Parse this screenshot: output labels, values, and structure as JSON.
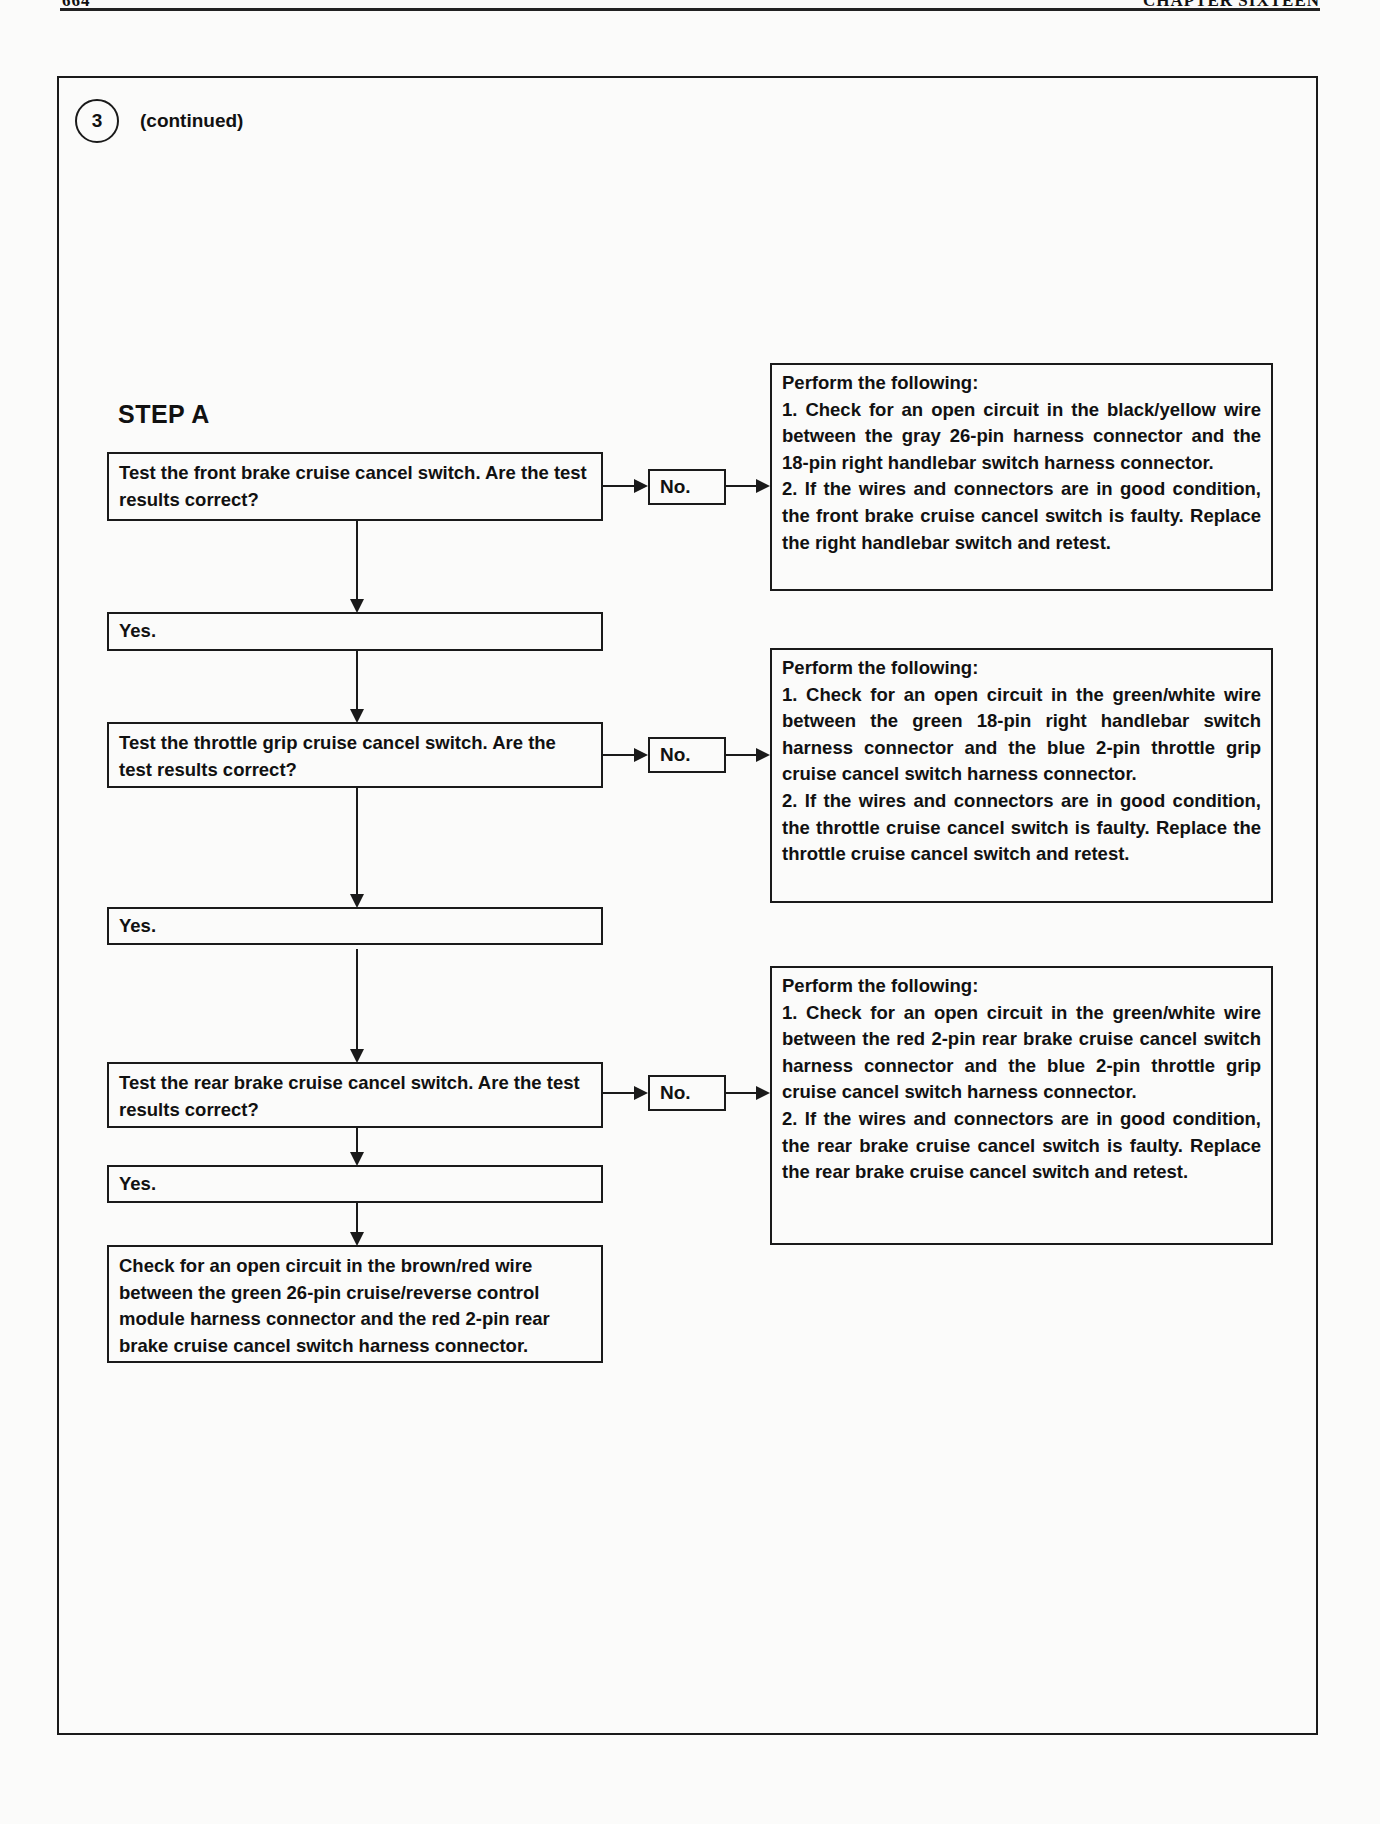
{
  "header": {
    "page_number": "664",
    "chapter": "CHAPTER SIXTEEN"
  },
  "section": {
    "step_number": "3",
    "continued_label": "(continued)"
  },
  "flowchart": {
    "title": "STEP A",
    "tests": [
      {
        "question": "Test the front brake cruise cancel switch. Are the test results correct?",
        "no_label": "No.",
        "yes_label": "Yes.",
        "no_action": {
          "heading": "Perform the following:",
          "steps": [
            "1. Check for an open circuit in the black/yellow wire between the gray 26-pin harness connector and the 18-pin right handlebar switch harness connector.",
            "2. If the wires and connectors are in good condition, the front brake cruise cancel switch is faulty. Replace the right handlebar switch and retest."
          ]
        }
      },
      {
        "question": "Test the throttle grip cruise cancel switch. Are the test results correct?",
        "no_label": "No.",
        "yes_label": "Yes.",
        "no_action": {
          "heading": "Perform the following:",
          "steps": [
            "1. Check for an open circuit in the green/white wire between the green 18-pin right handlebar switch harness connector and the blue 2-pin throttle grip cruise cancel switch harness connector.",
            "2. If the wires and connectors are in good condition, the throttle cruise cancel switch is faulty. Replace the throttle cruise cancel switch and retest."
          ]
        }
      },
      {
        "question": "Test the rear brake cruise cancel switch. Are the test results correct?",
        "no_label": "No.",
        "yes_label": "Yes.",
        "no_action": {
          "heading": "Perform the following:",
          "steps": [
            "1. Check for an open circuit in the green/white wire between the red 2-pin rear brake cruise cancel switch harness connector and the blue 2-pin throttle grip cruise cancel switch harness connector.",
            "2. If the wires and connectors are in good condition, the rear brake cruise cancel switch is faulty. Replace the rear brake cruise cancel switch and retest."
          ]
        }
      }
    ],
    "final_action": "Check for an open circuit in the brown/red wire between the green 26-pin cruise/reverse control module harness connector and the red 2-pin rear brake cruise cancel switch harness connector."
  }
}
